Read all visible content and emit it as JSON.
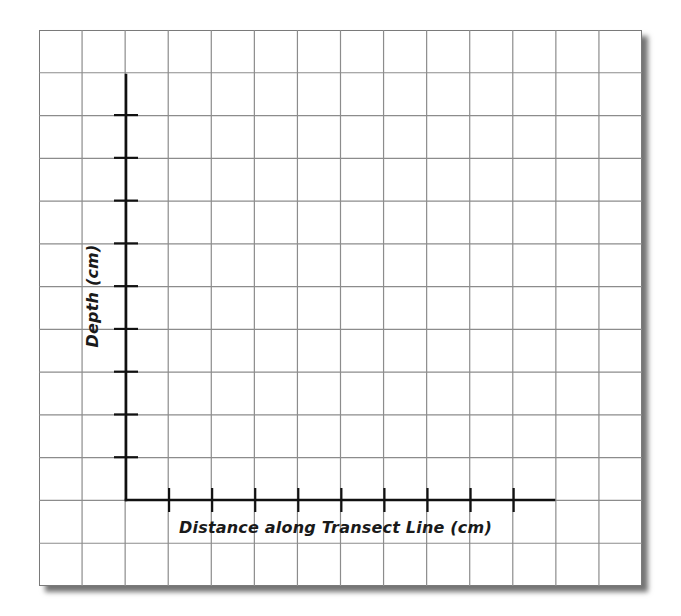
{
  "diagram": {
    "type": "blank graph paper with axes",
    "x_axis": {
      "label": "Distance along Transect Line (cm)",
      "tick_count": 9
    },
    "y_axis": {
      "label": "Depth (cm)",
      "tick_count": 9
    },
    "grid": {
      "columns": 14,
      "rows": 13
    },
    "colors": {
      "grid_line": "#8c8c8c",
      "border": "#7a7a7a",
      "axis": "#111111",
      "background": "#ffffff"
    }
  },
  "chart_data": {
    "type": "line",
    "title": "",
    "xlabel": "Distance along Transect Line (cm)",
    "ylabel": "Depth (cm)",
    "x_ticks": 9,
    "y_ticks": 9,
    "tick_labels_x": [],
    "tick_labels_y": [],
    "series": [],
    "grid": true,
    "legend": null
  }
}
